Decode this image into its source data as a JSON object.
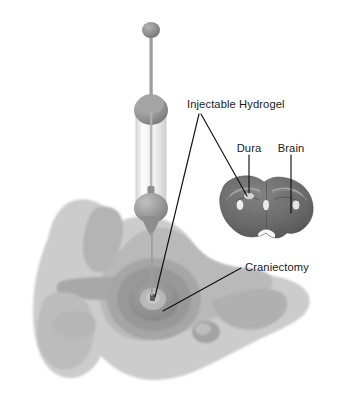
{
  "figure": {
    "background_color": "#ffffff",
    "label_color": "#1a1a1a",
    "leader_color": "#111111"
  },
  "labels": {
    "hydrogel": "Injectable Hydrogel",
    "dura": "Dura",
    "brain": "Brain",
    "craniectomy": "Craniectomy"
  },
  "anatomy": {
    "skull_outer_color": "#c9c9c9",
    "skull_mid_color": "#b2b2b2",
    "skull_inner_color": "#9e9e9e",
    "craniectomy_ring_color": "#8f8f8f",
    "brain_section_color": "#6f6f6f",
    "ventricle_color": "#f2f2f2"
  },
  "syringe": {
    "plunger_knob_color": "#8c8c8c",
    "plunger_rod_color": "#9a9a9a",
    "flange_color": "#949494",
    "barrel_color": "#e8e8e8",
    "needle_color": "#9a9a9a"
  }
}
